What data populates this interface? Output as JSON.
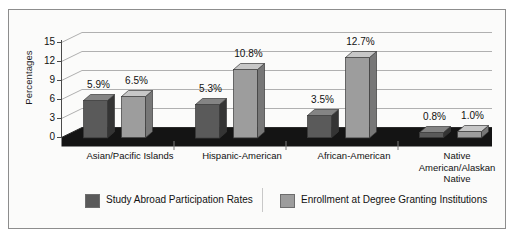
{
  "chart_data": {
    "type": "bar",
    "title": "",
    "subtitle": "",
    "xlabel": "",
    "ylabel": "Percentages",
    "ylim": [
      0,
      15
    ],
    "yticks": [
      "0",
      "3",
      "6",
      "9",
      "12",
      "15"
    ],
    "grid": true,
    "legend_position": "bottom",
    "style": "3d-clustered-column",
    "categories": [
      "Asian/Pacific Islands",
      "Hispanic-American",
      "African-American",
      "Native American/Alaskan Native"
    ],
    "category_lines": [
      [
        "Asian/Pacific Islands"
      ],
      [
        "Hispanic-American"
      ],
      [
        "African-American"
      ],
      [
        "Native",
        "American/Alaskan",
        "Native"
      ]
    ],
    "series": [
      {
        "name": "Study Abroad Participation Rates",
        "color": "#5a5a5a",
        "values": [
          5.9,
          5.3,
          3.5,
          0.8
        ],
        "labels": [
          "5.9%",
          "5.3%",
          "3.5%",
          "0.8%"
        ]
      },
      {
        "name": "Enrollment at Degree Granting Institutions",
        "color": "#9d9d9d",
        "values": [
          6.5,
          10.8,
          12.7,
          1.0
        ],
        "labels": [
          "6.5%",
          "10.8%",
          "12.7%",
          "1.0%"
        ]
      }
    ]
  },
  "legend": {
    "items": [
      {
        "label": "Study Abroad Participation Rates",
        "color": "#5a5a5a"
      },
      {
        "label": "Enrollment at Degree Granting Institutions",
        "color": "#9d9d9d"
      }
    ]
  },
  "colors": {
    "series_1": "#5a5a5a",
    "series_2": "#9d9d9d",
    "gridline": "#b0b0b0",
    "axis": "#4a4a4a",
    "floor": "#111111",
    "frame": "#8d8d8d",
    "background": "#fbfbfa",
    "text": "#111111"
  }
}
